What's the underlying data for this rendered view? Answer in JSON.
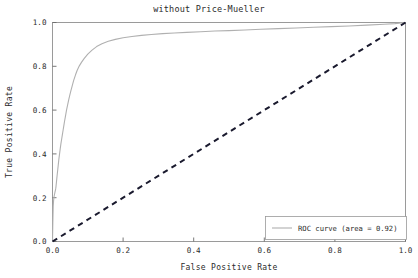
{
  "chart_data": {
    "type": "line",
    "title": "without Price-Mueller",
    "xlabel": "False Positive Rate",
    "ylabel": "True Positive Rate",
    "xlim": [
      0.0,
      1.0
    ],
    "ylim": [
      0.0,
      1.0
    ],
    "grid": false,
    "legend_position": "lower right",
    "xticks": [
      "0.0",
      "0.2",
      "0.4",
      "0.6",
      "0.8",
      "1.0"
    ],
    "xtick_values": [
      0.0,
      0.2,
      0.4,
      0.6,
      0.8,
      1.0
    ],
    "yticks": [
      "0.0",
      "0.2",
      "0.4",
      "0.6",
      "0.8",
      "1.0"
    ],
    "ytick_values": [
      0.0,
      0.2,
      0.4,
      0.6,
      0.8,
      1.0
    ],
    "auc": 0.92,
    "series": [
      {
        "name": "ROC curve (area = 0.92)",
        "style": "solid",
        "color": "#b0b0b0",
        "x": [
          0.0,
          0.001,
          0.002,
          0.003,
          0.004,
          0.005,
          0.006,
          0.007,
          0.008,
          0.009,
          0.01,
          0.011,
          0.012,
          0.013,
          0.014,
          0.015,
          0.016,
          0.017,
          0.018,
          0.02,
          0.022,
          0.024,
          0.026,
          0.028,
          0.03,
          0.032,
          0.034,
          0.036,
          0.038,
          0.04,
          0.043,
          0.046,
          0.049,
          0.052,
          0.056,
          0.06,
          0.065,
          0.07,
          0.076,
          0.082,
          0.09,
          0.1,
          0.112,
          0.125,
          0.14,
          0.158,
          0.178,
          0.2,
          0.225,
          0.252,
          0.28,
          0.312,
          0.345,
          0.38,
          0.42,
          0.46,
          0.5,
          0.545,
          0.59,
          0.64,
          0.69,
          0.74,
          0.79,
          0.84,
          0.89,
          0.94,
          0.97,
          1.0
        ],
        "y": [
          0.0,
          0.09,
          0.16,
          0.185,
          0.2,
          0.21,
          0.218,
          0.225,
          0.232,
          0.24,
          0.252,
          0.268,
          0.285,
          0.3,
          0.315,
          0.33,
          0.345,
          0.36,
          0.375,
          0.4,
          0.425,
          0.448,
          0.468,
          0.488,
          0.508,
          0.528,
          0.548,
          0.566,
          0.584,
          0.602,
          0.625,
          0.648,
          0.668,
          0.688,
          0.712,
          0.736,
          0.76,
          0.782,
          0.802,
          0.818,
          0.836,
          0.856,
          0.874,
          0.89,
          0.903,
          0.914,
          0.923,
          0.93,
          0.936,
          0.941,
          0.945,
          0.949,
          0.952,
          0.955,
          0.958,
          0.961,
          0.963,
          0.966,
          0.969,
          0.972,
          0.975,
          0.978,
          0.981,
          0.984,
          0.988,
          0.992,
          0.995,
          1.0
        ]
      },
      {
        "name": "chance-diagonal",
        "style": "dashed",
        "color": "#1a1a2e",
        "x": [
          0.0,
          1.0
        ],
        "y": [
          0.0,
          1.0
        ]
      }
    ]
  },
  "legend": {
    "entries": [
      {
        "label": "ROC curve (area = 0.92)",
        "swatch_color": "#b0b0b0"
      }
    ]
  }
}
